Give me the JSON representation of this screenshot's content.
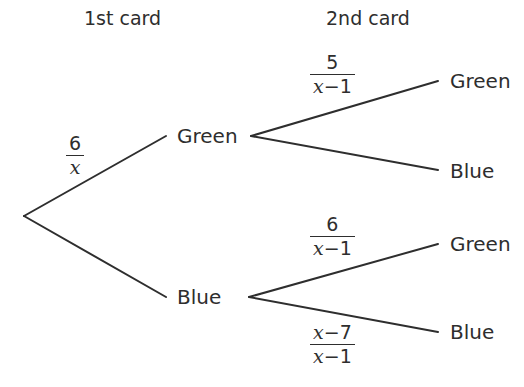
{
  "headers": {
    "first": "1st card",
    "second": "2nd card"
  },
  "tree": {
    "root": "",
    "level1": [
      {
        "label": "Green",
        "probability": {
          "numerator": "6",
          "denominator_var": "x",
          "denominator_rest": ""
        },
        "children": [
          {
            "label": "Green",
            "probability": {
              "numerator_var": "",
              "numerator": "5",
              "denominator_var": "x",
              "denominator_rest": "−1"
            }
          },
          {
            "label": "Blue",
            "probability": null
          }
        ]
      },
      {
        "label": "Blue",
        "probability": null,
        "children": [
          {
            "label": "Green",
            "probability": {
              "numerator_var": "",
              "numerator": "6",
              "denominator_var": "x",
              "denominator_rest": "−1"
            }
          },
          {
            "label": "Blue",
            "probability": {
              "numerator_var": "x",
              "numerator": "−7",
              "denominator_var": "x",
              "denominator_rest": "−1"
            }
          }
        ]
      }
    ]
  },
  "colors": {
    "ink": "#2e2e2e",
    "background": "#ffffff"
  }
}
